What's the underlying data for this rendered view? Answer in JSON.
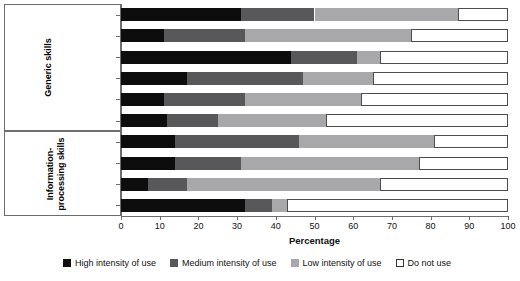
{
  "chart_data": {
    "type": "bar",
    "orientation": "horizontal",
    "stacked": true,
    "title": "",
    "xlabel": "Percentage",
    "ylabel": "",
    "xlim": [
      0,
      100
    ],
    "xticks": [
      0,
      10,
      20,
      30,
      40,
      50,
      60,
      70,
      80,
      90,
      100
    ],
    "grid": false,
    "legend_position": "bottom",
    "series": [
      {
        "name": "High intensity of use",
        "color": "#0d0d0d",
        "values": [
          31,
          11,
          44,
          17,
          11,
          12,
          14,
          14,
          7,
          32
        ]
      },
      {
        "name": "Medium intensity of use",
        "color": "#58585a",
        "values": [
          19,
          21,
          17,
          30,
          21,
          13,
          32,
          17,
          10,
          7
        ]
      },
      {
        "name": "Low intensity of use",
        "color": "#a8a8aa",
        "values": [
          37,
          43,
          6,
          18,
          30,
          28,
          35,
          46,
          50,
          4
        ]
      },
      {
        "name": "Do not use",
        "color": "#ffffff",
        "values": [
          13,
          25,
          33,
          35,
          38,
          47,
          19,
          23,
          33,
          57
        ]
      }
    ],
    "categories": [
      "Physical tasks",
      "Autonomy",
      "Interpersonal skills",
      "Problem solving",
      "Learning",
      "Repetitiveness",
      "Numeracy",
      "Reading",
      "Writing",
      "Computer use"
    ],
    "category_groups": [
      {
        "label": "Generic skills",
        "categories": [
          "Physical tasks",
          "Autonomy",
          "Interpersonal skills",
          "Problem solving",
          "Learning",
          "Repetitiveness"
        ]
      },
      {
        "label": "Information-processing skills",
        "categories": [
          "Numeracy",
          "Reading",
          "Writing",
          "Computer use"
        ]
      }
    ]
  },
  "axis": {
    "x_title": "Percentage",
    "tick_labels": [
      "0",
      "10",
      "20",
      "30",
      "40",
      "50",
      "60",
      "70",
      "80",
      "90",
      "100"
    ]
  },
  "groups": {
    "generic": "Generic skills",
    "information": "Information-processing skills"
  },
  "legend": {
    "items": [
      {
        "label": "High intensity of use"
      },
      {
        "label": "Medium intensity of use"
      },
      {
        "label": "Low intensity of use"
      },
      {
        "label": "Do not use"
      }
    ]
  },
  "colors": {
    "high": "#0d0d0d",
    "medium": "#58585a",
    "low": "#a8a8aa",
    "none": "#ffffff",
    "axis": "#6d6d6d"
  }
}
